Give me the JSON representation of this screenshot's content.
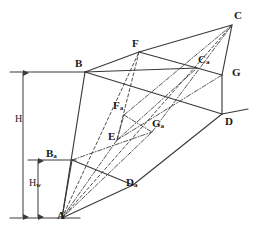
{
  "figure": {
    "stroke_color": "#3a3a3a",
    "label_color": "#1a1a1a",
    "background": "#ffffff"
  },
  "vertices": [
    {
      "id": "A",
      "label": "A",
      "sub": "",
      "x": 62,
      "y": 218,
      "label_x": 57,
      "label_y": 210
    },
    {
      "id": "B",
      "label": "B",
      "sub": "",
      "x": 85,
      "y": 72,
      "label_x": 75,
      "label_y": 58
    },
    {
      "id": "C",
      "label": "C",
      "sub": "",
      "x": 232,
      "y": 25,
      "label_x": 234,
      "label_y": 10
    },
    {
      "id": "D",
      "label": "D",
      "sub": "",
      "x": 222,
      "y": 114,
      "label_x": 225,
      "label_y": 116
    },
    {
      "id": "E",
      "label": "E",
      "sub": "",
      "x": 117,
      "y": 140,
      "label_x": 108,
      "label_y": 131
    },
    {
      "id": "F",
      "label": "F",
      "sub": "",
      "x": 139,
      "y": 52,
      "label_x": 132,
      "label_y": 38
    },
    {
      "id": "G",
      "label": "G",
      "sub": "",
      "x": 222,
      "y": 75,
      "label_x": 232,
      "label_y": 67
    },
    {
      "id": "Ba",
      "label": "B",
      "sub": "a",
      "x": 72,
      "y": 160,
      "label_x": 46,
      "label_y": 148
    },
    {
      "id": "Ca",
      "label": "C",
      "sub": "a",
      "x": 197,
      "y": 68,
      "label_x": 198,
      "label_y": 54
    },
    {
      "id": "Da",
      "label": "D",
      "sub": "a",
      "x": 133,
      "y": 185,
      "label_x": 126,
      "label_y": 177
    },
    {
      "id": "Fa",
      "label": "F",
      "sub": "a",
      "x": 124,
      "y": 115,
      "label_x": 113,
      "label_y": 100
    },
    {
      "id": "Ga",
      "label": "G",
      "sub": "a",
      "x": 152,
      "y": 132,
      "label_x": 152,
      "label_y": 118
    }
  ],
  "dimensions": [
    {
      "id": "H",
      "label": "H",
      "sub": "",
      "axis_x": 23,
      "top_y": 72,
      "bottom_y": 218,
      "label_x": 15,
      "label_y": 114,
      "tick_left": 10,
      "tick_right": 88
    },
    {
      "id": "Hw",
      "label": "H",
      "sub": "w",
      "axis_x": 38,
      "top_y": 160,
      "bottom_y": 218,
      "label_x": 29,
      "label_y": 178,
      "tick_left": 28,
      "tick_right": 76
    }
  ],
  "edges_solid": [
    {
      "name": "edge-A-B",
      "from": "A",
      "to": "B"
    },
    {
      "name": "edge-B-F",
      "from": "B",
      "to": "F"
    },
    {
      "name": "edge-F-C",
      "from": "F",
      "to": "C"
    },
    {
      "name": "edge-C-G",
      "from": "C",
      "to": "G"
    },
    {
      "name": "edge-G-D",
      "from": "G",
      "to": "D"
    },
    {
      "name": "edge-B-Ca",
      "from": "B",
      "to": "Ca"
    },
    {
      "name": "edge-Ca-G",
      "from": "Ca",
      "to": "G"
    },
    {
      "name": "edge-B-D",
      "from": "B",
      "to": "D"
    },
    {
      "name": "edge-A-Ba",
      "from": "A",
      "to": "Ba"
    },
    {
      "name": "edge-Ba-Da",
      "from": "Ba",
      "to": "Da"
    },
    {
      "name": "edge-Da-D",
      "from": "Da",
      "to": "D"
    },
    {
      "name": "edge-A-Da",
      "from": "A",
      "to": "Da"
    },
    {
      "name": "edge-F-Ca",
      "from": "F",
      "to": "Ca"
    }
  ],
  "edges_dashed": [
    {
      "name": "edge-F-E",
      "from": "F",
      "to": "E"
    },
    {
      "name": "edge-A-C",
      "from": "A",
      "to": "C"
    },
    {
      "name": "edge-A-F",
      "from": "A",
      "to": "F"
    }
  ],
  "edges_dashdot": [
    {
      "name": "edge-Ba-Ga",
      "from": "Ba",
      "to": "Ga"
    },
    {
      "name": "edge-Ga-C",
      "from": "Ga",
      "to": "C"
    },
    {
      "name": "edge-A-Ga",
      "from": "A",
      "to": "Ga"
    },
    {
      "name": "edge-E-Ca",
      "from": "E",
      "to": "Ca"
    },
    {
      "name": "edge-Fa-Ga",
      "from": "Fa",
      "to": "Ga"
    },
    {
      "name": "edge-E-Fa",
      "from": "E",
      "to": "Fa"
    },
    {
      "name": "edge-Fa-C",
      "from": "Fa",
      "to": "C"
    },
    {
      "name": "edge-A-E",
      "from": "A",
      "to": "E"
    },
    {
      "name": "edge-E-G",
      "from": "E",
      "to": "G"
    }
  ],
  "guide_lines": [
    {
      "name": "guide-top-left",
      "x1": 10,
      "y1": 72,
      "x2": 88,
      "y2": 72
    },
    {
      "name": "guide-mid-left",
      "x1": 28,
      "y1": 160,
      "x2": 76,
      "y2": 160
    },
    {
      "name": "guide-bottom-left",
      "x1": 10,
      "y1": 218,
      "x2": 80,
      "y2": 218
    },
    {
      "name": "guide-right-D",
      "x1": 222,
      "y1": 114,
      "x2": 248,
      "y2": 109
    }
  ]
}
